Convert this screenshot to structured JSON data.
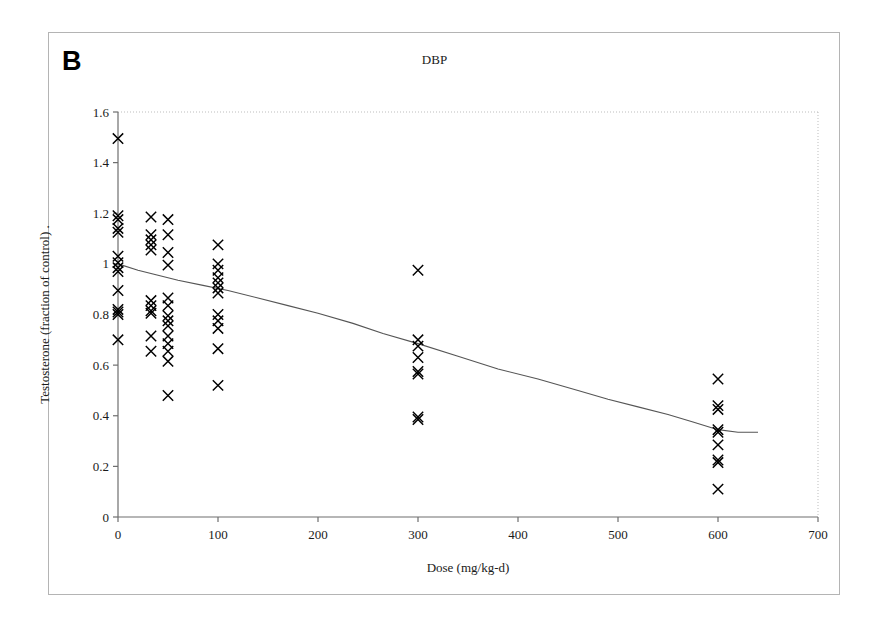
{
  "figure": {
    "panel_letter": "B",
    "title": "DBP",
    "background_color": "#ffffff",
    "frame_color": "#b4b4b4",
    "marker_color": "#000000",
    "curve_color": "#555555"
  },
  "chart_data": {
    "type": "scatter",
    "title": "DBP",
    "xlabel": "Dose (mg/kg-d)",
    "ylabel": "Testosterone (fraction of control)  .",
    "xlim": [
      0,
      700
    ],
    "ylim": [
      0,
      1.6
    ],
    "xticks": [
      0,
      100,
      200,
      300,
      400,
      500,
      600,
      700
    ],
    "yticks": [
      0,
      0.2,
      0.4,
      0.6,
      0.8,
      1,
      1.2,
      1.4,
      1.6
    ],
    "xtick_labels": [
      "0",
      "100",
      "200",
      "300",
      "400",
      "500",
      "600",
      "700"
    ],
    "ytick_labels": [
      "0",
      "0.2",
      "0.4",
      "0.6",
      "0.8",
      "1",
      "1.2",
      "1.4",
      "1.6"
    ],
    "grid": false,
    "legend": null,
    "marker": "x",
    "series": [
      {
        "name": "Testosterone observations",
        "marker": "x",
        "points": [
          {
            "x": 0,
            "y": 1.495
          },
          {
            "x": 0,
            "y": 1.19
          },
          {
            "x": 0,
            "y": 1.175
          },
          {
            "x": 0,
            "y": 1.14
          },
          {
            "x": 0,
            "y": 1.125
          },
          {
            "x": 0,
            "y": 1.03
          },
          {
            "x": 0,
            "y": 1.005
          },
          {
            "x": 0,
            "y": 0.985
          },
          {
            "x": 0,
            "y": 0.97
          },
          {
            "x": 0,
            "y": 0.895
          },
          {
            "x": 0,
            "y": 0.82
          },
          {
            "x": 0,
            "y": 0.81
          },
          {
            "x": 0,
            "y": 0.8
          },
          {
            "x": 0,
            "y": 0.7
          },
          {
            "x": 33,
            "y": 1.185
          },
          {
            "x": 33,
            "y": 1.115
          },
          {
            "x": 33,
            "y": 1.095
          },
          {
            "x": 33,
            "y": 1.075
          },
          {
            "x": 33,
            "y": 1.055
          },
          {
            "x": 33,
            "y": 0.855
          },
          {
            "x": 33,
            "y": 0.835
          },
          {
            "x": 33,
            "y": 0.815
          },
          {
            "x": 33,
            "y": 0.805
          },
          {
            "x": 33,
            "y": 0.715
          },
          {
            "x": 33,
            "y": 0.655
          },
          {
            "x": 50,
            "y": 1.175
          },
          {
            "x": 50,
            "y": 1.115
          },
          {
            "x": 50,
            "y": 1.045
          },
          {
            "x": 50,
            "y": 0.995
          },
          {
            "x": 50,
            "y": 0.865
          },
          {
            "x": 50,
            "y": 0.835
          },
          {
            "x": 50,
            "y": 0.795
          },
          {
            "x": 50,
            "y": 0.775
          },
          {
            "x": 50,
            "y": 0.755
          },
          {
            "x": 50,
            "y": 0.715
          },
          {
            "x": 50,
            "y": 0.685
          },
          {
            "x": 50,
            "y": 0.655
          },
          {
            "x": 50,
            "y": 0.615
          },
          {
            "x": 50,
            "y": 0.48
          },
          {
            "x": 100,
            "y": 1.075
          },
          {
            "x": 100,
            "y": 1.0
          },
          {
            "x": 100,
            "y": 0.975
          },
          {
            "x": 100,
            "y": 0.945
          },
          {
            "x": 100,
            "y": 0.925
          },
          {
            "x": 100,
            "y": 0.905
          },
          {
            "x": 100,
            "y": 0.885
          },
          {
            "x": 100,
            "y": 0.8
          },
          {
            "x": 100,
            "y": 0.775
          },
          {
            "x": 100,
            "y": 0.745
          },
          {
            "x": 100,
            "y": 0.665
          },
          {
            "x": 100,
            "y": 0.52
          },
          {
            "x": 300,
            "y": 0.975
          },
          {
            "x": 300,
            "y": 0.7
          },
          {
            "x": 300,
            "y": 0.675
          },
          {
            "x": 300,
            "y": 0.63
          },
          {
            "x": 300,
            "y": 0.575
          },
          {
            "x": 300,
            "y": 0.565
          },
          {
            "x": 300,
            "y": 0.395
          },
          {
            "x": 300,
            "y": 0.385
          },
          {
            "x": 600,
            "y": 0.545
          },
          {
            "x": 600,
            "y": 0.44
          },
          {
            "x": 600,
            "y": 0.425
          },
          {
            "x": 600,
            "y": 0.345
          },
          {
            "x": 600,
            "y": 0.335
          },
          {
            "x": 600,
            "y": 0.285
          },
          {
            "x": 600,
            "y": 0.225
          },
          {
            "x": 600,
            "y": 0.215
          },
          {
            "x": 600,
            "y": 0.11
          }
        ]
      }
    ],
    "fit_curve": {
      "name": "fitted dose-response curve",
      "points": [
        {
          "x": 0,
          "y": 1.0
        },
        {
          "x": 20,
          "y": 0.975
        },
        {
          "x": 40,
          "y": 0.955
        },
        {
          "x": 60,
          "y": 0.935
        },
        {
          "x": 85,
          "y": 0.915
        },
        {
          "x": 110,
          "y": 0.895
        },
        {
          "x": 140,
          "y": 0.865
        },
        {
          "x": 170,
          "y": 0.835
        },
        {
          "x": 200,
          "y": 0.805
        },
        {
          "x": 235,
          "y": 0.765
        },
        {
          "x": 265,
          "y": 0.725
        },
        {
          "x": 300,
          "y": 0.685
        },
        {
          "x": 340,
          "y": 0.635
        },
        {
          "x": 380,
          "y": 0.585
        },
        {
          "x": 420,
          "y": 0.545
        },
        {
          "x": 460,
          "y": 0.5
        },
        {
          "x": 490,
          "y": 0.465
        },
        {
          "x": 520,
          "y": 0.435
        },
        {
          "x": 550,
          "y": 0.405
        },
        {
          "x": 575,
          "y": 0.375
        },
        {
          "x": 600,
          "y": 0.345
        },
        {
          "x": 620,
          "y": 0.335
        },
        {
          "x": 640,
          "y": 0.335
        }
      ]
    }
  }
}
